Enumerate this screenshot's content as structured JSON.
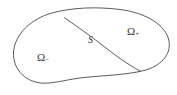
{
  "figure": {
    "type": "mathematical-domain-diagram",
    "background_color": "#ffffff",
    "stroke_color": "#4a4a4a",
    "stroke_width": 0.9,
    "labels": {
      "outer_region_left": {
        "symbol": "Ω",
        "subscript": "−",
        "full_text": "Ω₋",
        "x": 37,
        "y": 52
      },
      "outer_region_right": {
        "symbol": "Ω",
        "subscript": "+",
        "full_text": "Ω₊",
        "x": 127,
        "y": 26
      },
      "interface": {
        "symbol": "S",
        "full_text": "S",
        "x": 88,
        "y": 35
      }
    },
    "geometry": {
      "outer_boundary_path": "M 13.5 52.5 C 14.5 33.5 32 18.5 52 13.0 C 72 7.5 96 6.5 120 9.5 C 146 12.8 166 25.0 169.0 41.0 C 171.5 55.0 160.0 66.5 144.0 70.5 C 126.0 75.0 103.0 75.5 84.0 77.5 C 68.0 79.2 56.0 83.2 44.0 83.2 C 28.0 83.2 12.5 71.0 13.5 52.5 Z",
      "interface_path": "M 64.5 17.8 C 78.0 27.0 92.0 37.0 106.0 48.0 C 120.0 59.0 131.0 66.0 140.5 71.3",
      "intersection_top": [
        64.5,
        17.8
      ],
      "intersection_bottom": [
        140.5,
        71.3
      ],
      "bounds": {
        "left": 13,
        "right": 170,
        "top": 7,
        "bottom": 84
      }
    }
  }
}
